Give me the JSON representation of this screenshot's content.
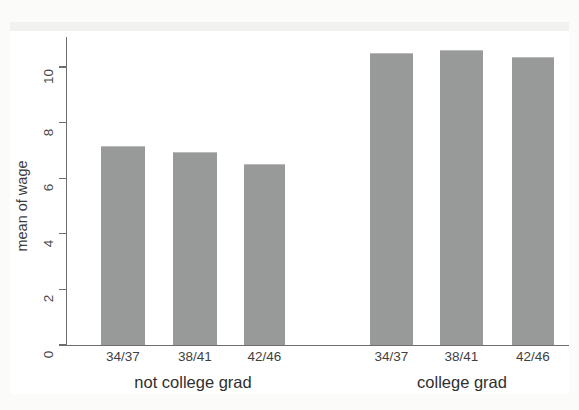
{
  "chart_data": {
    "type": "bar",
    "title": "",
    "subtitle": "",
    "xlabel": "",
    "ylabel": "mean of wage",
    "ylim": [
      0,
      11.4
    ],
    "yticks": [
      0,
      2,
      4,
      6,
      8,
      10
    ],
    "ytick_labels": [
      "0",
      "2",
      "4",
      "6",
      "8",
      "10"
    ],
    "grid": false,
    "legend": "none",
    "bar_color": "#989a99",
    "axis_color": "#6e6e6e",
    "categories": [
      "34/37",
      "38/41",
      "42/46",
      "34/37",
      "38/41",
      "42/46"
    ],
    "groups": [
      {
        "label": "not college grad",
        "categories": [
          "34/37",
          "38/41",
          "42/46"
        ],
        "values": [
          7.15,
          6.95,
          6.5
        ]
      },
      {
        "label": "college grad",
        "categories": [
          "34/37",
          "38/41",
          "42/46"
        ],
        "values": [
          10.5,
          10.6,
          10.35
        ]
      }
    ],
    "values": [
      7.15,
      6.95,
      6.5,
      10.5,
      10.6,
      10.35
    ]
  },
  "bars": [
    {
      "label": "34/37",
      "value": 7.15,
      "left": 101,
      "width": 44
    },
    {
      "label": "38/41",
      "value": 6.95,
      "left": 173,
      "width": 44
    },
    {
      "label": "42/46",
      "value": 6.5,
      "left": 244,
      "width": 41
    },
    {
      "label": "34/37",
      "value": 10.5,
      "left": 370,
      "width": 43
    },
    {
      "label": "38/41",
      "value": 10.6,
      "left": 440,
      "width": 43
    },
    {
      "label": "42/46",
      "value": 10.35,
      "left": 512,
      "width": 42
    }
  ],
  "group_labels": [
    {
      "text": "not college grad",
      "center": 193
    },
    {
      "text": "college grad",
      "center": 462
    }
  ],
  "scan_artifact": {
    "top_text": ""
  }
}
